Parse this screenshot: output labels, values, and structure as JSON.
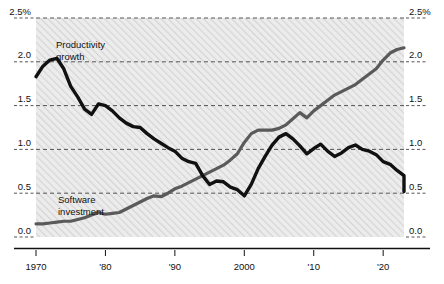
{
  "chart_data": {
    "type": "line",
    "title": "",
    "subtitle": "",
    "xlabel": "",
    "ylabel": "",
    "unit_label": "2.5%",
    "grid": true,
    "gridline_style": "dashed",
    "legend_position": "inline-annotation",
    "xlim": [
      1970,
      2023
    ],
    "ylim": [
      0.0,
      2.5
    ],
    "y_ticks": [
      {
        "value": 2.5,
        "label_left": "2.5%",
        "label_right": "2.5%"
      },
      {
        "value": 2.0,
        "label_left": "2.0",
        "label_right": "2.0"
      },
      {
        "value": 1.5,
        "label_left": "1.5",
        "label_right": "1.5"
      },
      {
        "value": 1.0,
        "label_left": "1.0",
        "label_right": "1.0"
      },
      {
        "value": 0.5,
        "label_left": "0.5",
        "label_right": "0.5"
      },
      {
        "value": 0.0,
        "label_left": "0.0",
        "label_right": "0.0"
      }
    ],
    "x_ticks": [
      {
        "value": 1970,
        "label": "1970"
      },
      {
        "value": 1980,
        "label": "'80"
      },
      {
        "value": 1990,
        "label": "'90"
      },
      {
        "value": 2000,
        "label": "2000"
      },
      {
        "value": 2010,
        "label": "'10"
      },
      {
        "value": 2020,
        "label": "'20"
      }
    ],
    "series": [
      {
        "name": "Productivity growth",
        "label": "Productivity growth",
        "label_line1": "Productivity",
        "label_line2": "growth",
        "color": "#111111",
        "x": [
          1970,
          1971,
          1972,
          1973,
          1974,
          1975,
          1976,
          1977,
          1978,
          1979,
          1980,
          1981,
          1982,
          1983,
          1984,
          1985,
          1986,
          1987,
          1988,
          1989,
          1990,
          1991,
          1992,
          1993,
          1994,
          1995,
          1996,
          1997,
          1998,
          1999,
          2000,
          2001,
          2002,
          2003,
          2004,
          2005,
          2006,
          2007,
          2008,
          2009,
          2010,
          2011,
          2012,
          2013,
          2014,
          2015,
          2016,
          2017,
          2018,
          2019,
          2020,
          2021,
          2022,
          2023
        ],
        "values": [
          1.83,
          1.95,
          2.02,
          2.04,
          1.92,
          1.72,
          1.6,
          1.46,
          1.4,
          1.52,
          1.5,
          1.44,
          1.36,
          1.3,
          1.26,
          1.25,
          1.18,
          1.12,
          1.07,
          1.02,
          0.98,
          0.9,
          0.86,
          0.84,
          0.7,
          0.6,
          0.64,
          0.63,
          0.57,
          0.54,
          0.47,
          0.6,
          0.78,
          0.92,
          1.05,
          1.14,
          1.18,
          1.12,
          1.04,
          0.95,
          1.01,
          1.06,
          0.98,
          0.92,
          0.96,
          1.02,
          1.05,
          1.0,
          0.98,
          0.94,
          0.86,
          0.83,
          0.76,
          0.7
        ],
        "end_value": 0.52
      },
      {
        "name": "Software investment",
        "label": "Software investment",
        "label_line1": "Software",
        "label_line2": "investment",
        "color": "#5a5a5a",
        "x": [
          1970,
          1971,
          1972,
          1973,
          1974,
          1975,
          1976,
          1977,
          1978,
          1979,
          1980,
          1981,
          1982,
          1983,
          1984,
          1985,
          1986,
          1987,
          1988,
          1989,
          1990,
          1991,
          1992,
          1993,
          1994,
          1995,
          1996,
          1997,
          1998,
          1999,
          2000,
          2001,
          2002,
          2003,
          2004,
          2005,
          2006,
          2007,
          2008,
          2009,
          2010,
          2011,
          2012,
          2013,
          2014,
          2015,
          2016,
          2017,
          2018,
          2019,
          2020,
          2021,
          2022,
          2023
        ],
        "values": [
          0.15,
          0.15,
          0.16,
          0.17,
          0.18,
          0.18,
          0.2,
          0.22,
          0.25,
          0.28,
          0.26,
          0.27,
          0.28,
          0.32,
          0.36,
          0.4,
          0.44,
          0.47,
          0.46,
          0.5,
          0.55,
          0.58,
          0.62,
          0.66,
          0.7,
          0.74,
          0.78,
          0.82,
          0.88,
          0.95,
          1.08,
          1.18,
          1.22,
          1.22,
          1.22,
          1.24,
          1.28,
          1.35,
          1.42,
          1.36,
          1.44,
          1.5,
          1.56,
          1.62,
          1.66,
          1.7,
          1.74,
          1.8,
          1.86,
          1.92,
          2.02,
          2.1,
          2.14,
          2.16
        ],
        "end_value": 2.16
      }
    ],
    "annotations": [
      {
        "text": "Productivity growth",
        "x_px": 56,
        "y_px": 45
      },
      {
        "text": "Software investment",
        "x_px": 58,
        "y_px": 200
      }
    ]
  },
  "plot": {
    "background": "#ebebeb",
    "hatch_color": "#d2d2d2",
    "axis_color": "#111111",
    "gridline_color": "#555555"
  }
}
